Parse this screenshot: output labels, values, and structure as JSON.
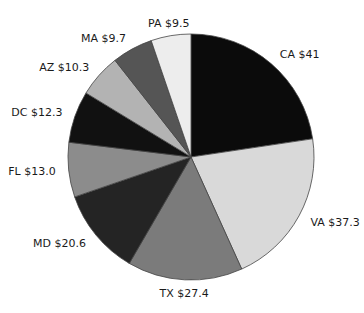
{
  "chart_data": {
    "type": "pie",
    "title": "",
    "start": "top",
    "direction": "clockwise",
    "slices": [
      {
        "label": "CA $41",
        "category": "CA",
        "value": 41.0,
        "color": "#0b0b0b"
      },
      {
        "label": "VA $37.3",
        "category": "VA",
        "value": 37.3,
        "color": "#d9d9d9"
      },
      {
        "label": "TX $27.4",
        "category": "TX",
        "value": 27.4,
        "color": "#7b7b7b"
      },
      {
        "label": "MD $20.6",
        "category": "MD",
        "value": 20.6,
        "color": "#242424"
      },
      {
        "label": "FL $13.0",
        "category": "FL",
        "value": 13.0,
        "color": "#8c8c8c"
      },
      {
        "label": "DC $12.3",
        "category": "DC",
        "value": 12.3,
        "color": "#111111"
      },
      {
        "label": "AZ $10.3",
        "category": "AZ",
        "value": 10.3,
        "color": "#b3b3b3"
      },
      {
        "label": "MA $9.7",
        "category": "MA",
        "value": 9.7,
        "color": "#555555"
      },
      {
        "label": "PA $9.5",
        "category": "PA",
        "value": 9.5,
        "color": "#ededed"
      }
    ]
  }
}
